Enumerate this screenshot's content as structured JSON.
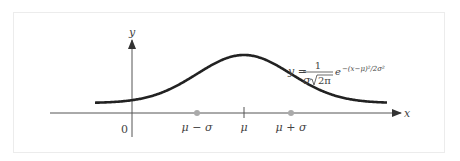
{
  "figure": {
    "type": "normal-distribution-curve",
    "axis_labels": {
      "x": "x",
      "y": "y"
    },
    "origin_label": "0",
    "tick_labels": [
      "μ − σ",
      "μ",
      "μ + σ"
    ],
    "equation": {
      "lhs": "y =",
      "numerator": "1",
      "denominator_sigma": "σ",
      "denominator_sqrt": "2π",
      "exp_base": "e",
      "exponent": "−(x−μ)²/2σ²"
    },
    "parameters": {
      "mean_symbol": "μ",
      "std_symbol": "σ"
    },
    "colors": {
      "curve": "#222222",
      "axes": "#555555",
      "points": "#aaaaaa"
    }
  }
}
